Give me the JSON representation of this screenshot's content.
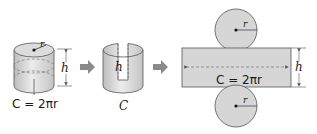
{
  "colors": {
    "fill": "#d6d6d6",
    "fill_light": "#e6e6e6",
    "stroke": "#555555",
    "arrow": "#8a8a8a",
    "text": "#1a1a1a"
  },
  "figures": {
    "cylinder": {
      "radius_label": "r",
      "height_label": "h",
      "circumference_label": "C = 2πr"
    },
    "opened_cylinder": {
      "height_label": "h",
      "circumference_label": "C"
    },
    "net": {
      "top_circle_radius_label": "r",
      "bottom_circle_radius_label": "r",
      "rectangle_length_label": "C = 2πr",
      "rectangle_height_label": "h"
    }
  },
  "arrows": [
    "step-arrow-1",
    "step-arrow-2"
  ]
}
